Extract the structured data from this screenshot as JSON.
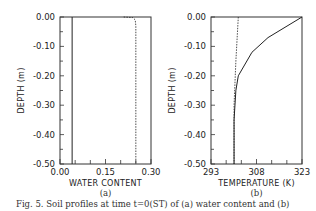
{
  "caption": "Fig. 5. Soil profiles at time t=0(ST) of (a) water content and (b)",
  "chart_data": [
    {
      "type": "line",
      "panel_label": "(a)",
      "xlabel": "WATER CONTENT",
      "ylabel": "DEPTH (m)",
      "xlim": [
        0.0,
        0.3
      ],
      "ylim": [
        -0.5,
        0.0
      ],
      "xticks": [
        "0.00",
        "0.15",
        "0.30"
      ],
      "yticks": [
        "0.00",
        "-0.10",
        "-0.20",
        "-0.30",
        "-0.40",
        "-0.50"
      ],
      "grid": false,
      "series": [
        {
          "name": "solid",
          "style": "solid",
          "x": [
            0.04,
            0.04
          ],
          "y": [
            0.0,
            -0.5
          ]
        },
        {
          "name": "dashed",
          "style": "dashed",
          "x": [
            0.21,
            0.24,
            0.248,
            0.25,
            0.25
          ],
          "y": [
            0.0,
            -0.002,
            -0.01,
            -0.03,
            -0.5
          ]
        }
      ]
    },
    {
      "type": "line",
      "panel_label": "(b)",
      "xlabel": "TEMPERATURE (K)",
      "ylabel": "DEPTH (m)",
      "xlim": [
        293,
        323
      ],
      "ylim": [
        -0.5,
        0.0
      ],
      "xticks": [
        "293",
        "308",
        "323"
      ],
      "yticks": [
        "0.00",
        "-0.10",
        "-0.20",
        "-0.30",
        "-0.40",
        "-0.50"
      ],
      "grid": false,
      "series": [
        {
          "name": "solid",
          "style": "solid",
          "x": [
            323,
            311.8,
            306.5,
            302,
            301.2,
            300.6,
            300.6
          ],
          "y": [
            0.0,
            -0.07,
            -0.12,
            -0.2,
            -0.25,
            -0.35,
            -0.5
          ]
        },
        {
          "name": "dashed",
          "style": "dashed",
          "x": [
            302,
            301.2,
            300.6,
            300.6
          ],
          "y": [
            0.0,
            -0.15,
            -0.3,
            -0.5
          ]
        }
      ]
    }
  ]
}
